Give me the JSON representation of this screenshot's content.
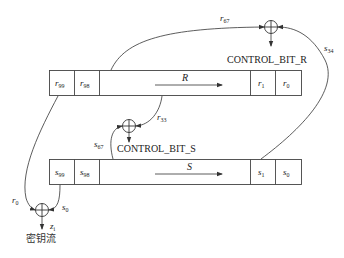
{
  "diagram": {
    "registers": {
      "R": {
        "name": "R",
        "cells_left": [
          {
            "base": "r",
            "index": "99"
          },
          {
            "base": "r",
            "index": "98"
          }
        ],
        "cells_right": [
          {
            "base": "r",
            "index": "1"
          },
          {
            "base": "r",
            "index": "0"
          }
        ],
        "shift_direction": "right"
      },
      "S": {
        "name": "S",
        "cells_left": [
          {
            "base": "s",
            "index": "99"
          },
          {
            "base": "s",
            "index": "98"
          }
        ],
        "cells_right": [
          {
            "base": "s",
            "index": "1"
          },
          {
            "base": "s",
            "index": "0"
          }
        ],
        "shift_direction": "right"
      }
    },
    "xor_nodes": {
      "top": {
        "output_label": "CONTROL_BIT_R",
        "inputs": [
          {
            "base": "r",
            "index": "67"
          },
          {
            "base": "s",
            "index": "34"
          }
        ]
      },
      "middle": {
        "output_label": "CONTROL_BIT_S",
        "inputs": [
          {
            "base": "r",
            "index": "33"
          },
          {
            "base": "s",
            "index": "67"
          }
        ]
      },
      "bottom": {
        "output_label": "密钥流",
        "output_symbol": {
          "base": "z",
          "index": "i"
        },
        "inputs": [
          {
            "base": "r",
            "index": "0"
          },
          {
            "base": "s",
            "index": "0"
          }
        ]
      }
    },
    "caption": "..."
  }
}
